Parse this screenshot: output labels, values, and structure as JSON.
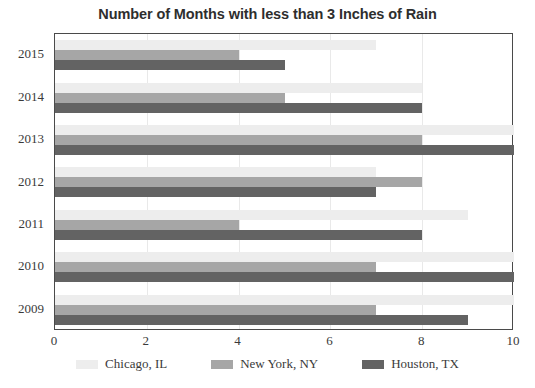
{
  "chart_data": {
    "type": "bar",
    "orientation": "horizontal",
    "title": "Number of Months with less than 3 Inches of Rain",
    "xlabel": "",
    "ylabel": "",
    "xlim": [
      0,
      10
    ],
    "xticks": [
      0,
      2,
      4,
      6,
      8,
      10
    ],
    "xtick_labels": [
      "0",
      "2",
      "4",
      "6",
      "8",
      "10"
    ],
    "categories": [
      "2015",
      "2014",
      "2013",
      "2012",
      "2011",
      "2010",
      "2009"
    ],
    "grid": true,
    "legend_position": "bottom",
    "series": [
      {
        "name": "Chicago, IL",
        "color": "#ededed",
        "values": [
          7,
          8,
          10,
          7,
          9,
          10,
          10
        ]
      },
      {
        "name": "New York, NY",
        "color": "#a6a6a6",
        "values": [
          4,
          5,
          8,
          8,
          4,
          7,
          7
        ]
      },
      {
        "name": "Houston, TX",
        "color": "#636363",
        "values": [
          5,
          8,
          10,
          7,
          8,
          10,
          9
        ]
      }
    ]
  },
  "colors": {
    "frame": "#4a4a4a",
    "grid": "#e9e9e9",
    "text": "#3a3a3a",
    "title": "#2e2e2e",
    "background": "#ffffff"
  }
}
